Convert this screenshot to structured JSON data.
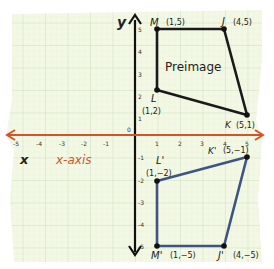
{
  "diagram": {
    "axes": {
      "x_label": "x",
      "y_label": "y",
      "x_axis_caption": "x-axis",
      "origin_label": "0",
      "x_ticks": [
        "-5",
        "-4",
        "-3",
        "-2",
        "-1",
        "1",
        "2",
        "3",
        "4",
        "5"
      ],
      "y_ticks": [
        "5",
        "4",
        "3",
        "2",
        "1",
        "-1",
        "-2",
        "-3",
        "-4",
        "-5"
      ],
      "x_axis_color": "#d2552a",
      "y_axis_color": "#111111"
    },
    "preimage": {
      "label": "Preimage",
      "color": "#1a1a1a",
      "points": [
        {
          "name": "M",
          "coord_label": "(1,5)",
          "x": 1,
          "y": 5
        },
        {
          "name": "J",
          "coord_label": "(4,5)",
          "x": 4,
          "y": 5
        },
        {
          "name": "K",
          "coord_label": "(5,1)",
          "x": 5,
          "y": 1
        },
        {
          "name": "L",
          "coord_label": "(1,2)",
          "x": 1,
          "y": 2
        }
      ]
    },
    "image": {
      "color": "#3d5485",
      "points": [
        {
          "name": "M'",
          "coord_label": "(1,−5)",
          "x": 1,
          "y": -5
        },
        {
          "name": "J'",
          "coord_label": "(4,−5)",
          "x": 4,
          "y": -5
        },
        {
          "name": "K'",
          "coord_label": "(5,−1)",
          "x": 5,
          "y": -1
        },
        {
          "name": "L'",
          "coord_label": "(1,−2)",
          "x": 1,
          "y": -2
        }
      ]
    },
    "paper_color": "#f3f8e4",
    "grid_color": "#cfe3c6"
  }
}
